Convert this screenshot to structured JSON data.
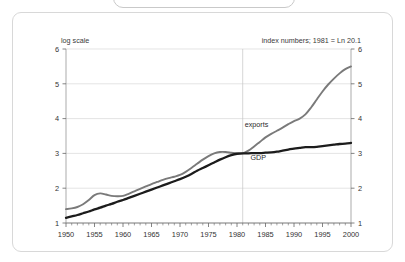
{
  "frame": {
    "card_border_color": "#d8d8d8",
    "background_color": "#ffffff"
  },
  "annotations": {
    "scale_note": "log scale",
    "index_note": "index numbers; 1981 = Ln 20.1"
  },
  "chart_data": {
    "type": "line",
    "title": "",
    "subtitle": "",
    "xlabel": "",
    "ylabel": "",
    "xlim": [
      1950,
      2000
    ],
    "ylim": [
      1,
      6
    ],
    "grid": true,
    "legend_position": "inline-annotation",
    "x_ticks": [
      1950,
      1955,
      1960,
      1965,
      1970,
      1975,
      1980,
      1985,
      1990,
      1995,
      2000
    ],
    "y_ticks": [
      1,
      2,
      3,
      4,
      5,
      6
    ],
    "y_ticks_right": [
      1,
      2,
      3,
      4,
      5,
      6
    ],
    "minor_x_tick_interval": 1,
    "reference_line_x": 1981,
    "series": [
      {
        "name": "exports",
        "color": "#7a7a7a",
        "label_x": 1981,
        "label_y": 3.75,
        "x": [
          1950,
          1951,
          1952,
          1953,
          1954,
          1955,
          1956,
          1957,
          1958,
          1959,
          1960,
          1961,
          1962,
          1963,
          1964,
          1965,
          1966,
          1967,
          1968,
          1969,
          1970,
          1971,
          1972,
          1973,
          1974,
          1975,
          1976,
          1977,
          1978,
          1979,
          1980,
          1981,
          1982,
          1983,
          1984,
          1985,
          1986,
          1987,
          1988,
          1989,
          1990,
          1991,
          1992,
          1993,
          1994,
          1995,
          1996,
          1997,
          1998,
          1999,
          2000
        ],
        "values": [
          1.4,
          1.42,
          1.46,
          1.54,
          1.66,
          1.8,
          1.85,
          1.82,
          1.78,
          1.77,
          1.78,
          1.84,
          1.91,
          1.98,
          2.05,
          2.12,
          2.18,
          2.24,
          2.29,
          2.33,
          2.38,
          2.47,
          2.58,
          2.7,
          2.82,
          2.92,
          3.0,
          3.04,
          3.04,
          3.02,
          3.0,
          3.0,
          3.08,
          3.2,
          3.33,
          3.46,
          3.56,
          3.65,
          3.74,
          3.84,
          3.93,
          4.0,
          4.12,
          4.32,
          4.55,
          4.78,
          4.98,
          5.15,
          5.3,
          5.42,
          5.5
        ]
      },
      {
        "name": "GDP",
        "color": "#1c1c1c",
        "label_x": 1982,
        "label_y": 2.8,
        "x": [
          1950,
          1951,
          1952,
          1953,
          1954,
          1955,
          1956,
          1957,
          1958,
          1959,
          1960,
          1961,
          1962,
          1963,
          1964,
          1965,
          1966,
          1967,
          1968,
          1969,
          1970,
          1971,
          1972,
          1973,
          1974,
          1975,
          1976,
          1977,
          1978,
          1979,
          1980,
          1981,
          1982,
          1983,
          1984,
          1985,
          1986,
          1987,
          1988,
          1989,
          1990,
          1991,
          1992,
          1993,
          1994,
          1995,
          1996,
          1997,
          1998,
          1999,
          2000
        ],
        "values": [
          1.15,
          1.19,
          1.23,
          1.28,
          1.33,
          1.39,
          1.44,
          1.5,
          1.55,
          1.61,
          1.66,
          1.72,
          1.78,
          1.84,
          1.9,
          1.96,
          2.02,
          2.08,
          2.14,
          2.2,
          2.26,
          2.33,
          2.41,
          2.5,
          2.58,
          2.66,
          2.74,
          2.82,
          2.89,
          2.95,
          2.99,
          3.0,
          3.0,
          3.01,
          3.01,
          3.02,
          3.03,
          3.05,
          3.08,
          3.11,
          3.14,
          3.16,
          3.18,
          3.18,
          3.19,
          3.21,
          3.23,
          3.25,
          3.27,
          3.28,
          3.3
        ]
      }
    ]
  }
}
